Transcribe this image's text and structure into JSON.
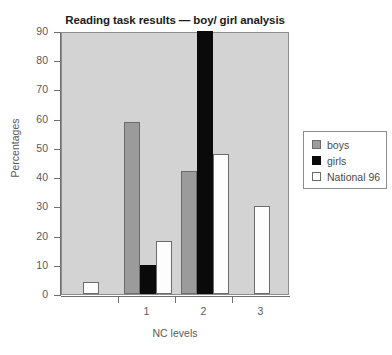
{
  "chart_data": {
    "type": "bar",
    "title": "Reading task results — boy/ girl analysis",
    "xlabel": "NC levels",
    "ylabel": "Percentages",
    "categories": [
      "",
      "1",
      "2",
      "3"
    ],
    "series": [
      {
        "name": "boys",
        "color": "#9b9b9b",
        "values": [
          0,
          59,
          42,
          0
        ]
      },
      {
        "name": "girls",
        "color": "#0a0a0a",
        "values": [
          0,
          10,
          90,
          0
        ]
      },
      {
        "name": "National 96",
        "color": "#ffffff",
        "values": [
          4,
          18,
          48,
          30
        ]
      }
    ],
    "ylim": [
      0,
      90
    ],
    "yticks": [
      0,
      10,
      20,
      30,
      40,
      50,
      60,
      70,
      80,
      90
    ],
    "xticks": [
      "1",
      "2",
      "3"
    ],
    "grid": false,
    "legend_position": "right-outside",
    "plot_background": "#d3d3d3"
  }
}
